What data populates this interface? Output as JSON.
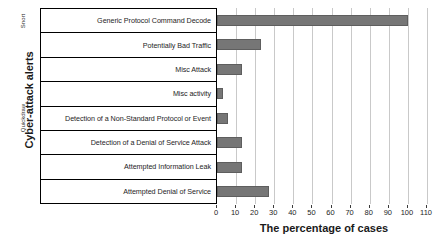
{
  "chart_data": {
    "type": "bar",
    "orientation": "horizontal",
    "title": "",
    "xlabel": "The percentage of cases",
    "ylabel": "Cyber-attack alerts",
    "xlim": [
      0,
      110
    ],
    "xticks": [
      0,
      10,
      20,
      30,
      40,
      50,
      60,
      70,
      80,
      90,
      100,
      110
    ],
    "grid": true,
    "legend": "none",
    "bar_color": "#767676",
    "categories": [
      "Generic Protocol Command Decode",
      "Potentially Bad Traffic",
      "Misc Attack",
      "Misc activity",
      "Detection of a Non-Standard Protocol or Event",
      "Detection of a Denial of Service Attack",
      "Attempted Information Leak",
      "Attempted Denial of Service"
    ],
    "values": [
      100,
      23,
      13,
      3,
      6,
      13,
      13,
      27
    ],
    "groups": [
      {
        "label": "Snort",
        "categories": [
          "Generic Protocol Command Decode"
        ]
      },
      {
        "label": "Quickdraw",
        "categories": [
          "Potentially Bad Traffic",
          "Misc Attack",
          "Misc activity",
          "Detection of a Non-Standard Protocol or Event",
          "Detection of a Denial of Service Attack",
          "Attempted Information Leak",
          "Attempted Denial of Service"
        ]
      }
    ]
  }
}
